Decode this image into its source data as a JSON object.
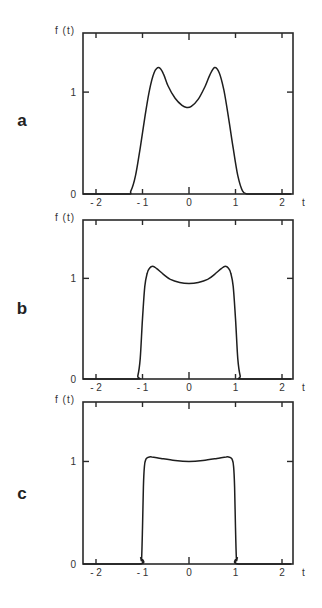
{
  "chart_data": [
    {
      "panel": "a",
      "type": "line",
      "title": "",
      "xlabel": "t",
      "ylabel": "f(t)",
      "xlim": [
        -2.3,
        2.2
      ],
      "ylim": [
        0,
        1.58
      ],
      "xticks": [
        -2,
        -1,
        0,
        1,
        2
      ],
      "xtick_labels": [
        "-2",
        "-1",
        "0",
        "1",
        "2"
      ],
      "yticks": [
        0,
        1
      ],
      "ytick_labels": [
        "0",
        "1"
      ],
      "grid": false,
      "series": [
        {
          "name": "f(t)",
          "x": [
            -2.3,
            -1.35,
            -1.25,
            -1.15,
            -1.05,
            -0.95,
            -0.85,
            -0.75,
            -0.65,
            -0.55,
            -0.45,
            -0.3,
            -0.15,
            -0.05,
            0.05,
            0.2,
            0.35,
            0.45,
            0.55,
            0.65,
            0.75,
            0.85,
            0.95,
            1.05,
            1.15,
            1.25,
            1.35,
            2.2
          ],
          "y": [
            0,
            0,
            0.03,
            0.18,
            0.45,
            0.75,
            1.02,
            1.19,
            1.24,
            1.18,
            1.06,
            0.94,
            0.87,
            0.85,
            0.86,
            0.93,
            1.06,
            1.17,
            1.24,
            1.19,
            1.02,
            0.75,
            0.45,
            0.18,
            0.03,
            0,
            0,
            0
          ]
        }
      ]
    },
    {
      "panel": "b",
      "type": "line",
      "title": "",
      "xlabel": "t",
      "ylabel": "f(t)",
      "xlim": [
        -2.3,
        2.2
      ],
      "ylim": [
        0,
        1.58
      ],
      "xticks": [
        -2,
        -1,
        0,
        1,
        2
      ],
      "xtick_labels": [
        "-2",
        "-1",
        "0",
        "1",
        "2"
      ],
      "yticks": [
        0,
        1
      ],
      "ytick_labels": [
        "0",
        "1"
      ],
      "grid": false,
      "series": [
        {
          "name": "f(t)",
          "x": [
            -2.3,
            -1.15,
            -1.1,
            -1.05,
            -1.0,
            -0.95,
            -0.9,
            -0.85,
            -0.78,
            -0.7,
            -0.55,
            -0.4,
            -0.2,
            0.0,
            0.2,
            0.4,
            0.55,
            0.7,
            0.78,
            0.85,
            0.9,
            0.95,
            1.0,
            1.05,
            1.1,
            1.15,
            2.2
          ],
          "y": [
            0,
            0,
            0.03,
            0.2,
            0.6,
            0.92,
            1.05,
            1.1,
            1.12,
            1.1,
            1.04,
            0.99,
            0.96,
            0.95,
            0.96,
            0.99,
            1.04,
            1.1,
            1.12,
            1.1,
            1.05,
            0.92,
            0.6,
            0.2,
            0.03,
            0,
            0
          ]
        }
      ]
    },
    {
      "panel": "c",
      "type": "line",
      "title": "",
      "xlabel": "t",
      "ylabel": "f(t)",
      "xlim": [
        -2.3,
        2.2
      ],
      "ylim": [
        0,
        1.58
      ],
      "xticks": [
        -2,
        -1,
        0,
        1,
        2
      ],
      "xtick_labels": [
        "-2",
        "-1",
        "0",
        "1",
        "2"
      ],
      "yticks": [
        0,
        1
      ],
      "ytick_labels": [
        "0",
        "1"
      ],
      "grid": false,
      "series": [
        {
          "name": "f(t)",
          "x": [
            -2.3,
            -1.07,
            -1.04,
            -1.02,
            -1.0,
            -0.98,
            -0.96,
            -0.93,
            -0.88,
            -0.8,
            -0.6,
            -0.3,
            0.0,
            0.3,
            0.6,
            0.8,
            0.88,
            0.93,
            0.96,
            0.98,
            1.0,
            1.02,
            1.04,
            1.07,
            2.2
          ],
          "y": [
            0,
            0,
            0.06,
            0.05,
            0.35,
            0.75,
            0.95,
            1.02,
            1.04,
            1.045,
            1.03,
            1.01,
            1.0,
            1.01,
            1.03,
            1.045,
            1.04,
            1.02,
            0.95,
            0.75,
            0.35,
            0.05,
            0.06,
            0,
            0
          ]
        }
      ]
    }
  ],
  "panels": [
    {
      "letter": "a",
      "ylabel": "f(t)",
      "xlabel": "t",
      "xtick_labels": [
        "-2",
        "-1",
        "0",
        "1",
        "2"
      ],
      "ytick_labels": [
        "0",
        "1"
      ]
    },
    {
      "letter": "b",
      "ylabel": "f(t)",
      "xlabel": "t",
      "xtick_labels": [
        "-2",
        "-1",
        "0",
        "1",
        "2"
      ],
      "ytick_labels": [
        "0",
        "1"
      ]
    },
    {
      "letter": "c",
      "ylabel": "f(t)",
      "xlabel": "t",
      "xtick_labels": [
        "-2",
        "-1",
        "0",
        "1",
        "2"
      ],
      "ytick_labels": [
        "0",
        "1"
      ]
    }
  ]
}
